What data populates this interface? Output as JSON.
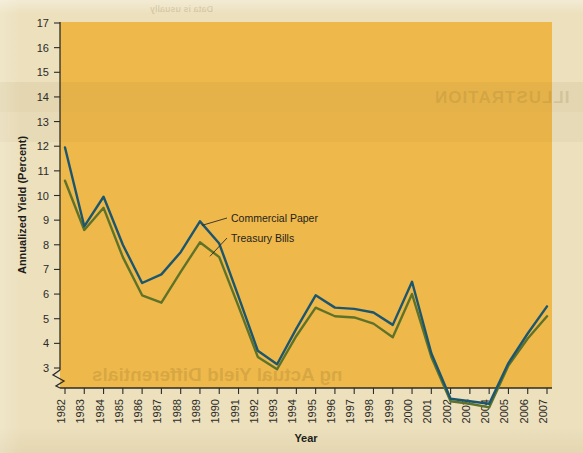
{
  "figure": {
    "y_axis_title": "Annualized Yield (Percent)",
    "x_axis_title": "Year",
    "plot_background_color": "#eeb84a",
    "page_background_color": "#ece0bd",
    "axis_break_present": true
  },
  "legend": {
    "commercial_paper_label": "Commercial Paper",
    "treasury_bills_label": "Treasury Bills"
  },
  "bleedthrough": {
    "headline": "ILLUSTRATION",
    "footer": "ng Actual Yield Differentials",
    "top_caption": "Data is usually"
  },
  "chart_data": {
    "type": "line",
    "title": "",
    "xlabel": "Year",
    "ylabel": "Annualized Yield (Percent)",
    "grid": false,
    "legend_position": "inline-callout",
    "ylim": [
      2.6,
      17
    ],
    "ytick_labels": [
      "17",
      "16",
      "15",
      "14",
      "13",
      "12",
      "11",
      "10",
      "9",
      "8",
      "7",
      "6",
      "5",
      "4",
      "3"
    ],
    "yticks": [
      17,
      16,
      15,
      14,
      13,
      12,
      11,
      10,
      9,
      8,
      7,
      6,
      5,
      4,
      3
    ],
    "categories": [
      "1982",
      "1983",
      "1984",
      "1985",
      "1986",
      "1987",
      "1988",
      "1989",
      "1990",
      "1991",
      "1992",
      "1993",
      "1994",
      "1995",
      "1996",
      "1997",
      "1998",
      "1999",
      "2000",
      "2001",
      "2002",
      "2003",
      "2004",
      "2005",
      "2006",
      "2007"
    ],
    "x": [
      1982,
      1983,
      1984,
      1985,
      1986,
      1987,
      1988,
      1989,
      1990,
      1991,
      1992,
      1993,
      1994,
      1995,
      1996,
      1997,
      1998,
      1999,
      2000,
      2001,
      2002,
      2003,
      2004,
      2005,
      2006,
      2007
    ],
    "series": [
      {
        "name": "Commercial Paper",
        "color": "#1c566e",
        "values": [
          11.95,
          8.75,
          9.95,
          8.0,
          6.45,
          6.8,
          7.7,
          8.95,
          8.05,
          5.9,
          3.7,
          3.15,
          4.6,
          5.95,
          5.45,
          5.4,
          5.25,
          4.75,
          6.5,
          3.6,
          1.75,
          1.65,
          1.55,
          3.2,
          4.4,
          5.5
        ],
        "highlight_points": [
          {
            "x": 1982,
            "y": 11.95
          },
          {
            "x": 1989,
            "y": 8.95
          },
          {
            "x": 2000,
            "y": 6.5
          },
          {
            "x": 2004,
            "y": 1.55
          },
          {
            "x": 2007,
            "y": 5.5
          }
        ]
      },
      {
        "name": "Treasury Bills",
        "color": "#5f7229",
        "values": [
          10.6,
          8.6,
          9.5,
          7.5,
          5.95,
          5.65,
          6.9,
          8.1,
          7.5,
          5.5,
          3.45,
          2.95,
          4.3,
          5.45,
          5.1,
          5.05,
          4.8,
          4.25,
          6.0,
          3.45,
          1.65,
          1.55,
          1.4,
          3.1,
          4.2,
          5.1
        ],
        "highlight_points": [
          {
            "x": 1982,
            "y": 10.6
          },
          {
            "x": 1989,
            "y": 8.1
          },
          {
            "x": 2000,
            "y": 6.0
          },
          {
            "x": 2004,
            "y": 1.4
          },
          {
            "x": 2007,
            "y": 5.1
          }
        ]
      }
    ]
  }
}
